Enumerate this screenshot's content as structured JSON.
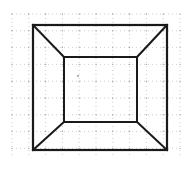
{
  "figure": {
    "background_color": "#ffffff",
    "ink_color": "#1a1a1a",
    "grid_color": "#b9b9c2",
    "grid_dot_color": "#a8a8b4",
    "center_dot_color": "#8f8f9a",
    "canvas": {
      "width": 191,
      "height": 178
    }
  },
  "grid": {
    "name": "dotted-graph-paper",
    "x_start": 12,
    "x_end": 180,
    "y_start": 14,
    "y_end": 155,
    "spacing": 16.8,
    "dash_pattern": "1 3",
    "stroke_width": 0.7,
    "columns": 11,
    "rows": 9
  },
  "chart_data": {
    "type": "diagram",
    "units": "pixels",
    "outer_square": {
      "name": "outer-square",
      "top_left": [
        33,
        25
      ],
      "top_right": [
        167,
        25
      ],
      "bottom_right": [
        167,
        150
      ],
      "bottom_left": [
        33,
        150
      ],
      "width": 134,
      "height": 125,
      "stroke_width": 2.2
    },
    "inner_square": {
      "name": "inner-square",
      "top_left": [
        64,
        57
      ],
      "top_right": [
        137,
        57
      ],
      "bottom_right": [
        137,
        122
      ],
      "bottom_left": [
        64,
        122
      ],
      "width": 73,
      "height": 65,
      "stroke_width": 2.0
    },
    "diagonals": [
      {
        "name": "diagonal-top-left",
        "from": [
          33,
          25
        ],
        "to": [
          64,
          57
        ]
      },
      {
        "name": "diagonal-top-right",
        "from": [
          167,
          25
        ],
        "to": [
          137,
          57
        ]
      },
      {
        "name": "diagonal-bottom-right",
        "from": [
          167,
          150
        ],
        "to": [
          137,
          122
        ]
      },
      {
        "name": "diagonal-bottom-left",
        "from": [
          33,
          150
        ],
        "to": [
          64,
          122
        ]
      }
    ],
    "center_mark": {
      "name": "center-dot",
      "position": [
        78,
        76
      ],
      "radius": 0.9
    },
    "diagonal_stroke_width": 2.0
  }
}
